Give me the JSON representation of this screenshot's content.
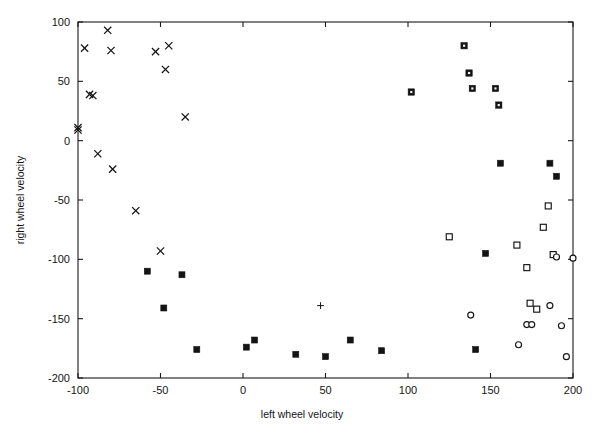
{
  "chart_data": {
    "type": "scatter",
    "title": "",
    "xlabel": "left wheel velocity",
    "ylabel": "right wheel velocity",
    "xlim": [
      -100,
      200
    ],
    "ylim": [
      -200,
      100
    ],
    "xticks": [
      -100,
      -50,
      0,
      50,
      100,
      150,
      200
    ],
    "xticklabels": [
      "-100",
      "-50",
      "0",
      "50",
      "100",
      "150",
      "200"
    ],
    "yticks": [
      -200,
      -150,
      -100,
      -50,
      0,
      50,
      100
    ],
    "yticklabels": [
      "-200",
      "-150",
      "-100",
      "-50",
      "0",
      "50",
      "100"
    ],
    "grid": false,
    "legend": null,
    "frame": "box",
    "series": [
      {
        "name": "cross-markers",
        "marker": "x",
        "points": [
          [
            -100,
            9
          ],
          [
            -100,
            11
          ],
          [
            -96,
            78
          ],
          [
            -93,
            39
          ],
          [
            -91,
            38
          ],
          [
            -88,
            -11
          ],
          [
            -82,
            93
          ],
          [
            -80,
            76
          ],
          [
            -79,
            -24
          ],
          [
            -65,
            -59
          ],
          [
            -53,
            75
          ],
          [
            -50,
            -93
          ],
          [
            -47,
            60
          ],
          [
            -45,
            80
          ],
          [
            -35,
            20
          ]
        ]
      },
      {
        "name": "filled-square-markers",
        "marker": "filled-square",
        "points": [
          [
            -58,
            -110
          ],
          [
            -48,
            -141
          ],
          [
            -37,
            -113
          ],
          [
            -28,
            -176
          ],
          [
            2,
            -174
          ],
          [
            7,
            -168
          ],
          [
            32,
            -180
          ],
          [
            50,
            -182
          ],
          [
            65,
            -168
          ],
          [
            84,
            -177
          ],
          [
            141,
            -176
          ],
          [
            147,
            -95
          ],
          [
            156,
            -19
          ],
          [
            186,
            -19
          ],
          [
            190,
            -30
          ]
        ]
      },
      {
        "name": "asterisk-markers",
        "marker": "square-dot",
        "points": [
          [
            102,
            41
          ],
          [
            134,
            80
          ],
          [
            137,
            57
          ],
          [
            139,
            44
          ],
          [
            153,
            44
          ],
          [
            155,
            30
          ]
        ]
      },
      {
        "name": "open-square-markers",
        "marker": "open-square",
        "points": [
          [
            125,
            -81
          ],
          [
            166,
            -88
          ],
          [
            172,
            -107
          ],
          [
            174,
            -137
          ],
          [
            178,
            -142
          ],
          [
            182,
            -73
          ],
          [
            185,
            -55
          ],
          [
            188,
            -96
          ]
        ]
      },
      {
        "name": "open-circle-markers",
        "marker": "open-circle",
        "points": [
          [
            138,
            -147
          ],
          [
            167,
            -172
          ],
          [
            172,
            -155
          ],
          [
            175,
            -155
          ],
          [
            186,
            -139
          ],
          [
            190,
            -98
          ],
          [
            193,
            -156
          ],
          [
            196,
            -182
          ],
          [
            200,
            -99
          ]
        ]
      },
      {
        "name": "plus-marker",
        "marker": "plus",
        "points": [
          [
            47,
            -139
          ]
        ]
      }
    ]
  }
}
